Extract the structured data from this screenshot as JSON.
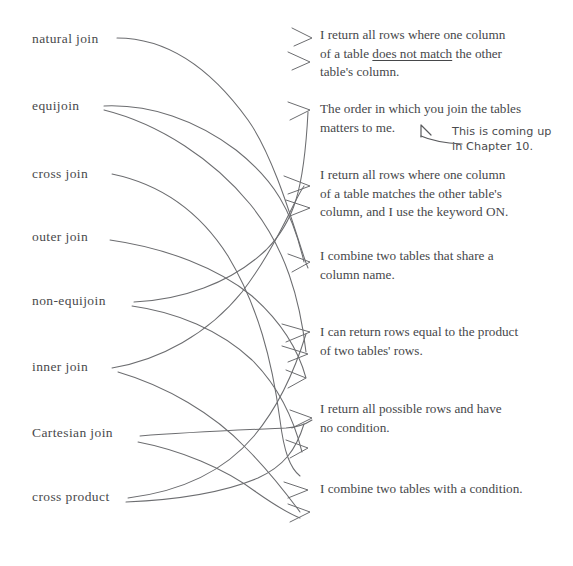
{
  "page": {
    "width": 573,
    "height": 566,
    "background": "#ffffff",
    "ink_color": "#46474a",
    "line_color": "#6c6d70"
  },
  "terms": [
    {
      "id": "natural-join",
      "label": "natural join",
      "x": 32,
      "y": 32
    },
    {
      "id": "equijoin",
      "label": "equijoin",
      "x": 32,
      "y": 99
    },
    {
      "id": "cross-join",
      "label": "cross join",
      "x": 32,
      "y": 167
    },
    {
      "id": "outer-join",
      "label": "outer join",
      "x": 32,
      "y": 230
    },
    {
      "id": "non-equijoin",
      "label": "non-equijoin",
      "x": 32,
      "y": 294
    },
    {
      "id": "inner-join",
      "label": "inner join",
      "x": 32,
      "y": 360
    },
    {
      "id": "cartesian-join",
      "label": "Cartesian join",
      "x": 32,
      "y": 426
    },
    {
      "id": "cross-product",
      "label": "cross product",
      "x": 32,
      "y": 490
    }
  ],
  "descriptions": [
    {
      "id": "does-not-match",
      "x": 320,
      "y": 26,
      "lines": [
        {
          "pre": "I return all rows where one column",
          "underline": "",
          "post": ""
        },
        {
          "pre": "of a table ",
          "underline": "does not match",
          "post": " the other"
        },
        {
          "pre": "table's column.",
          "underline": "",
          "post": ""
        }
      ]
    },
    {
      "id": "order-matters",
      "x": 320,
      "y": 100,
      "lines": [
        {
          "pre": "The order in which you join the tables",
          "underline": "",
          "post": ""
        },
        {
          "pre": "matters to me.",
          "underline": "",
          "post": ""
        }
      ]
    },
    {
      "id": "matches-keyword-on",
      "x": 320,
      "y": 166,
      "lines": [
        {
          "pre": "I return all rows where one column",
          "underline": "",
          "post": ""
        },
        {
          "pre": "of a table matches the other table's",
          "underline": "",
          "post": ""
        },
        {
          "pre": "column, and I use the keyword ON.",
          "underline": "",
          "post": ""
        }
      ]
    },
    {
      "id": "share-column-name",
      "x": 320,
      "y": 247,
      "lines": [
        {
          "pre": "I combine two tables that share a",
          "underline": "",
          "post": ""
        },
        {
          "pre": "column name.",
          "underline": "",
          "post": ""
        }
      ]
    },
    {
      "id": "product-of-rows",
      "x": 320,
      "y": 323,
      "lines": [
        {
          "pre": "I can return rows equal to the product",
          "underline": "",
          "post": ""
        },
        {
          "pre": "of two tables' rows.",
          "underline": "",
          "post": ""
        }
      ]
    },
    {
      "id": "all-possible-rows",
      "x": 320,
      "y": 400,
      "lines": [
        {
          "pre": "I return all possible rows and have",
          "underline": "",
          "post": ""
        },
        {
          "pre": "no condition.",
          "underline": "",
          "post": ""
        }
      ]
    },
    {
      "id": "combine-with-condition",
      "x": 320,
      "y": 480,
      "lines": [
        {
          "pre": "I combine two tables with a condition.",
          "underline": "",
          "post": ""
        }
      ]
    }
  ],
  "annotation": {
    "id": "chapter-note",
    "text": "This is coming up\nin Chapter 10.",
    "x": 452,
    "y": 124
  },
  "connector_paths": [
    "M117,38 C170,38 212,70 248,120 C278,162 300,250 308,268",
    "M104,106 C150,104 196,120 236,150 C274,180 292,210 304,262",
    "M104,110 C160,124 214,160 250,204 C286,248 300,300 306,352",
    "M112,174 C160,184 200,212 228,256 C258,306 272,360 280,420 C284,452 290,468 300,476",
    "M110,240 C166,248 218,268 252,296 C286,326 300,356 306,378",
    "M134,302 C180,300 230,284 266,250 C294,222 304,190 308,112",
    "M132,306 C176,312 220,330 252,360 C284,392 296,428 302,452",
    "M112,368 C160,360 208,334 242,292 C276,248 294,200 304,186",
    "M118,372 C166,386 214,414 246,448 C272,474 288,496 300,512",
    "M140,436 C190,432 240,430 286,428 C300,427 306,424 312,420",
    "M138,442 C180,450 224,468 256,492 C276,506 290,514 300,518",
    "M128,498 C176,492 222,474 254,436 C284,400 298,360 306,334",
    "M126,502 C172,500 220,494 258,478 C284,466 296,450 304,424"
  ],
  "arrow_heads": [
    "M292,28 L312,38 L294,46",
    "M288,52 L310,62 L292,70",
    "M288,102 L310,110 L290,120",
    "M284,176 L310,186 L288,194",
    "M286,200 L310,208 L290,216",
    "M288,254 L310,262 L292,272",
    "M282,324 L310,332 L286,342",
    "M282,346 L308,354 L288,362",
    "M286,370 L306,378 L288,388",
    "M290,410 L312,418 L292,428",
    "M286,440 L308,448 L290,458",
    "M284,482 L308,490 L288,498",
    "M288,504 L310,512 L290,522"
  ]
}
